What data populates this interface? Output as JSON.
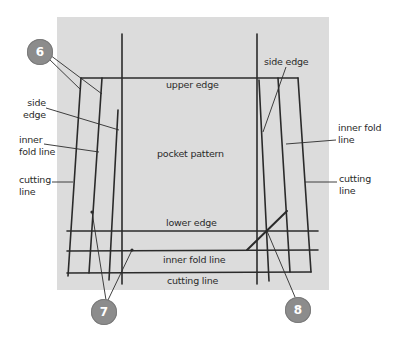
{
  "diagram": {
    "title": "pocket pattern",
    "paper_color": "#dcdcdc",
    "line_color": "#2b2b2b",
    "callout_color": "#8c8c8c",
    "labels": {
      "upper_edge": "upper edge",
      "pocket_pattern": "pocket pattern",
      "lower_edge": "lower edge",
      "inner_fold_bottom": "inner fold line",
      "cutting_bottom": "cutting line",
      "left_side_edge_1": "side",
      "left_side_edge_2": "edge",
      "left_inner_fold_1": "inner",
      "left_inner_fold_2": "fold line",
      "left_cutting_1": "cutting",
      "left_cutting_2": "line",
      "right_side_edge": "side edge",
      "right_inner_fold_1": "inner fold",
      "right_inner_fold_2": "line",
      "right_cutting_1": "cutting",
      "right_cutting_2": "line"
    },
    "callouts": [
      {
        "id": "6",
        "label": "6"
      },
      {
        "id": "7",
        "label": "7"
      },
      {
        "id": "8",
        "label": "8"
      }
    ]
  }
}
